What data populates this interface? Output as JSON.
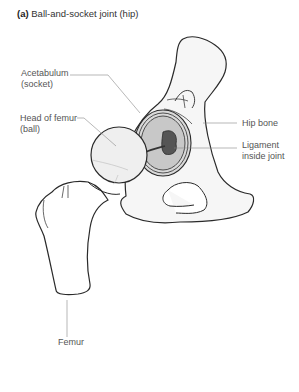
{
  "figure": {
    "title_prefix": "(a)",
    "title": "Ball-and-socket joint (hip)"
  },
  "labels": {
    "acetabulum_line1": "Acetabulum",
    "acetabulum_line2": "(socket)",
    "head_line1": "Head of femur",
    "head_line2": "(ball)",
    "hip_bone": "Hip bone",
    "ligament_line1": "Ligament",
    "ligament_line2": "inside joint",
    "femur": "Femur"
  },
  "colors": {
    "outline": "#2a2a2a",
    "leader": "#888888",
    "bone_fill": "#f4f4f4",
    "socket_fill": "#cfcfcf",
    "ligament_fill": "#555555"
  }
}
